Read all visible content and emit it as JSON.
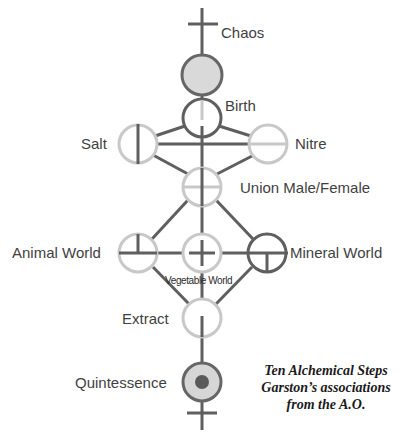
{
  "title": "Ten Alchemical Steps",
  "caption": {
    "line1": "Ten Alchemical Steps",
    "line2": "Garston’s associations",
    "line3": "from the A.O."
  },
  "colors": {
    "dark_stroke": "#5f5f5f",
    "light_stroke": "#c8c8c8",
    "fill_gray": "#d9d9d9",
    "dot": "#5a5a5a",
    "text": "#3f3f3f"
  },
  "nodes": [
    {
      "id": "chaos",
      "label": "Chaos",
      "symbol": "filled-circle-with-cross-above"
    },
    {
      "id": "birth",
      "label": "Birth",
      "symbol": "circle-with-half-vertical-line"
    },
    {
      "id": "salt",
      "label": "Salt",
      "symbol": "circle-with-vertical-line"
    },
    {
      "id": "nitre",
      "label": "Nitre",
      "symbol": "circle-with-horizontal-line"
    },
    {
      "id": "union",
      "label": "Union Male/Female",
      "symbol": "circle-with-cross"
    },
    {
      "id": "animal",
      "label": "Animal World",
      "symbol": "circle-horizontal-line-upper-vertical"
    },
    {
      "id": "vegetable",
      "label": "Vegetable World",
      "symbol": "circle-with-inner-cross"
    },
    {
      "id": "mineral",
      "label": "Mineral World",
      "symbol": "circle-horizontal-line-lower-vertical"
    },
    {
      "id": "extract",
      "label": "Extract",
      "symbol": "circle-with-half-vertical-line"
    },
    {
      "id": "quintessence",
      "label": "Quintessence",
      "symbol": "filled-circle-with-dot-cross-below"
    }
  ]
}
